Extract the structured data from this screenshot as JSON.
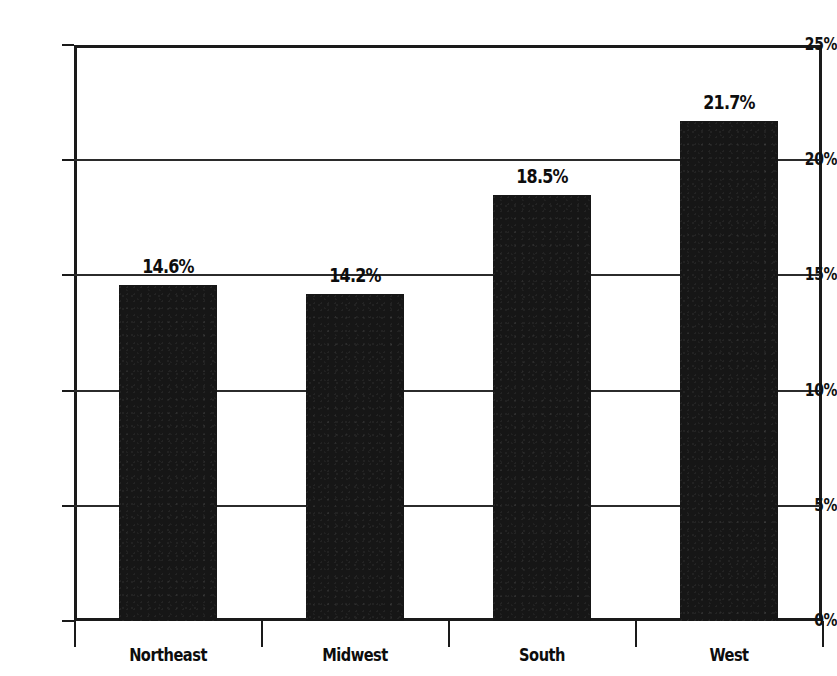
{
  "chart_data": {
    "type": "bar",
    "title": "",
    "xlabel": "",
    "ylabel": "",
    "categories": [
      "Northeast",
      "Midwest",
      "South",
      "West"
    ],
    "values": [
      14.6,
      14.2,
      18.5,
      21.7
    ],
    "value_labels": [
      "14.6%",
      "14.2%",
      "18.5%",
      "21.7%"
    ],
    "ylim": [
      0,
      25
    ],
    "ytick_values": [
      25,
      20,
      15,
      10,
      5,
      0
    ],
    "ytick_labels": [
      "25%",
      "20%",
      "15%",
      "10%",
      "5%",
      "0%"
    ],
    "grid": true,
    "legend": null,
    "series_color": "#161616"
  },
  "figure": {
    "clipped_title_fragment": ""
  }
}
